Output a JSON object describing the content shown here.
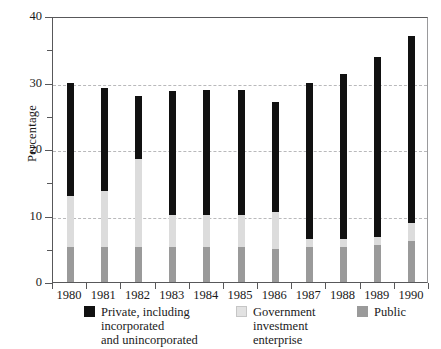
{
  "chart_data": {
    "type": "bar",
    "subtype": "stacked-vertical",
    "title": "",
    "xlabel": "",
    "ylabel": "Percentage",
    "ylim": [
      0,
      40
    ],
    "yticks": [
      0,
      10,
      20,
      30,
      40
    ],
    "ytick_labels": [
      "0",
      "10",
      "20",
      "30",
      "40"
    ],
    "yminor_ticks": [
      5,
      15,
      25,
      35
    ],
    "gridlines": [
      10,
      20,
      30
    ],
    "grid": "horizontal-dashed",
    "legend_position": "bottom",
    "categories": [
      "1980",
      "1981",
      "1982",
      "1983",
      "1984",
      "1985",
      "1986",
      "1987",
      "1988",
      "1989",
      "1990"
    ],
    "series": [
      {
        "name": "Public",
        "color": "#9a9a9a",
        "values": [
          5.3,
          5.2,
          5.2,
          5.2,
          5.2,
          5.3,
          4.9,
          5.2,
          5.3,
          5.6,
          6.2
        ]
      },
      {
        "name": "Government investment enterprise",
        "color": "#dcdcdc",
        "values": [
          7.7,
          8.5,
          13.3,
          4.9,
          4.9,
          4.8,
          5.6,
          1.2,
          1.1,
          1.1,
          2.7
        ]
      },
      {
        "name": "Private, including incorporated and unincorporated",
        "color": "#111111",
        "values": [
          17.0,
          15.5,
          9.5,
          18.6,
          18.7,
          18.8,
          16.6,
          23.6,
          24.9,
          27.2,
          28.1
        ]
      }
    ],
    "totals": [
      30.0,
      29.2,
      28.0,
      28.7,
      28.8,
      28.9,
      27.1,
      30.0,
      31.3,
      33.9,
      37.0
    ],
    "legend": [
      {
        "key": "private",
        "label": "Private, including\nincorporated\nand unincorporated",
        "color": "#111111"
      },
      {
        "key": "government",
        "label": "Government\ninvestment\nenterprise",
        "color": "#dcdcdc"
      },
      {
        "key": "public",
        "label": "Public",
        "color": "#9a9a9a"
      }
    ]
  }
}
